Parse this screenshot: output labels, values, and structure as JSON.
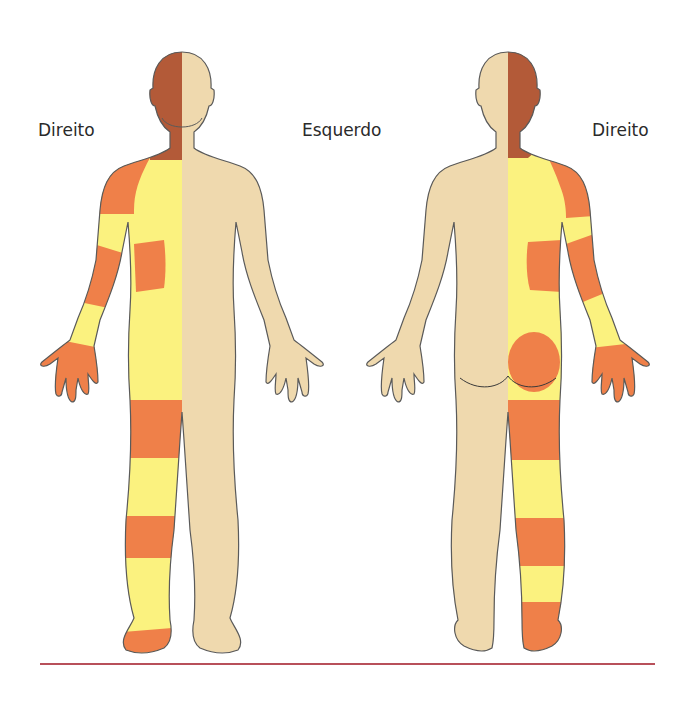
{
  "labels": {
    "front_right": "Direito",
    "center_left": "Esquerdo",
    "back_right": "Direito"
  },
  "colors": {
    "head_zone": "#B35A38",
    "high_zone": "#EF8049",
    "mid_zone": "#FBF27F",
    "unaffected": "#EFD9AE",
    "outline": "#5a5a5a",
    "rule": "#B8505A"
  },
  "figures": [
    {
      "view": "front",
      "affected_side": "right",
      "zones": [
        "head",
        "shoulder",
        "upper-arm-band",
        "forearm-band",
        "hand",
        "flank-patch",
        "thigh-band",
        "calf-band",
        "foot"
      ]
    },
    {
      "view": "back",
      "affected_side": "right",
      "zones": [
        "head",
        "shoulder",
        "upper-arm-band",
        "forearm-band",
        "hand",
        "flank-patch",
        "buttock",
        "thigh-band",
        "calf-band",
        "foot"
      ]
    }
  ]
}
